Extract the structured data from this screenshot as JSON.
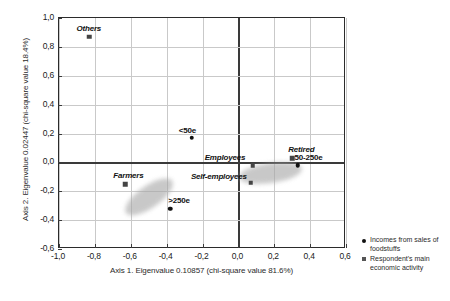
{
  "chart_data": {
    "type": "scatter",
    "title": "",
    "xlabel": "Axis 1. Eigenvalue 0.10857 (chi-square value 81.6%)",
    "ylabel": "Axis 2. Eigenvalue 0.02447 (chi-square value 18.4%)",
    "xlim": [
      -1.0,
      0.6
    ],
    "ylim": [
      -0.6,
      1.0
    ],
    "grid": true,
    "legend_position": "right",
    "xticks": [
      "-1,0",
      "-0,8",
      "-0,6",
      "-0,4",
      "-0,2",
      "0,0",
      "0,2",
      "0,4",
      "0,6"
    ],
    "xtick_values": [
      -1.0,
      -0.8,
      -0.6,
      -0.4,
      -0.2,
      0.0,
      0.2,
      0.4,
      0.6
    ],
    "yticks": [
      "1,0",
      "0,8",
      "0,6",
      "0,4",
      "0,2",
      "0,0",
      "-0,2",
      "-0,4",
      "-0,6"
    ],
    "ytick_values": [
      1.0,
      0.8,
      0.6,
      0.4,
      0.2,
      0.0,
      -0.2,
      -0.4,
      -0.6
    ],
    "series": [
      {
        "name": "Incomes from sales of foodstuffs",
        "marker": "circle",
        "points": [
          {
            "label": "<50e",
            "x": -0.26,
            "y": 0.17,
            "label_dx": -13,
            "label_dy": -12
          },
          {
            "label": ">250e",
            "x": -0.38,
            "y": -0.32,
            "label_dx": -2,
            "label_dy": -13
          },
          {
            "label": "50-250e",
            "x": 0.33,
            "y": -0.02,
            "label_dx": -3,
            "label_dy": -12
          }
        ]
      },
      {
        "name": "Respondent's main economic activity",
        "marker": "square",
        "points": [
          {
            "label": "Others",
            "x": -0.83,
            "y": 0.87,
            "label_dx": -13,
            "label_dy": -13
          },
          {
            "label": "Farmers",
            "x": -0.63,
            "y": -0.15,
            "label_dx": -12,
            "label_dy": -13
          },
          {
            "label": "Employees",
            "x": 0.08,
            "y": -0.02,
            "label_dx": -48,
            "label_dy": -12
          },
          {
            "label": "Self-employees",
            "x": 0.07,
            "y": -0.14,
            "label_dx": -60,
            "label_dy": -11
          },
          {
            "label": "Retired",
            "x": 0.3,
            "y": 0.03,
            "label_dx": -4,
            "label_dy": -13
          }
        ]
      }
    ],
    "clusters": [
      {
        "name": "lower-left-cluster",
        "cx": -0.5,
        "cy": -0.24,
        "rx": 0.155,
        "ry": 0.075,
        "rotation": -35
      },
      {
        "name": "right-cluster",
        "cx": 0.18,
        "cy": -0.07,
        "rx": 0.175,
        "ry": 0.068,
        "rotation": -8
      }
    ]
  },
  "legend": {
    "entries": [
      {
        "marker": "circle",
        "label": "Incomes from sales of foodstuffs"
      },
      {
        "marker": "square",
        "label": "Respondent's main economic activity"
      }
    ]
  }
}
